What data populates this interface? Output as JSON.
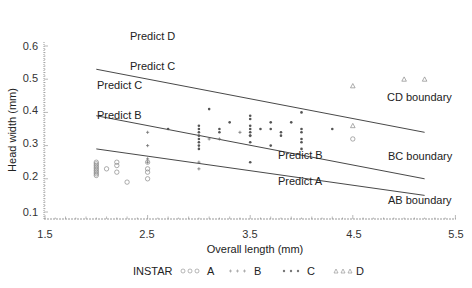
{
  "chart_data": {
    "type": "scatter",
    "title": "",
    "xlabel": "Overall length (mm)",
    "ylabel": "Head width (mm)",
    "xlim": [
      1.5,
      5.5
    ],
    "ylim": [
      0.1,
      0.6
    ],
    "xticks": [
      "1.5",
      "2.5",
      "3.5",
      "4.5",
      "5.5"
    ],
    "yticks": [
      "0.1",
      "0.2",
      "0.3",
      "0.4",
      "0.5",
      "0.6"
    ],
    "grid": false,
    "legend": {
      "title": "INSTAR",
      "position": "bottom",
      "entries": [
        {
          "name": "A",
          "marker": "circle"
        },
        {
          "name": "B",
          "marker": "plus"
        },
        {
          "name": "C",
          "marker": "star"
        },
        {
          "name": "D",
          "marker": "triangle"
        }
      ]
    },
    "series": [
      {
        "name": "A",
        "marker": "circle",
        "points": [
          [
            2.0,
            0.25
          ],
          [
            2.0,
            0.245
          ],
          [
            2.0,
            0.24
          ],
          [
            2.0,
            0.235
          ],
          [
            2.0,
            0.23
          ],
          [
            2.0,
            0.225
          ],
          [
            2.0,
            0.22
          ],
          [
            2.0,
            0.215
          ],
          [
            2.0,
            0.21
          ],
          [
            2.1,
            0.23
          ],
          [
            2.2,
            0.25
          ],
          [
            2.2,
            0.24
          ],
          [
            2.2,
            0.22
          ],
          [
            2.3,
            0.19
          ],
          [
            2.5,
            0.25
          ],
          [
            2.5,
            0.23
          ],
          [
            2.5,
            0.22
          ],
          [
            2.5,
            0.2
          ],
          [
            4.5,
            0.32
          ]
        ]
      },
      {
        "name": "B",
        "marker": "plus",
        "points": [
          [
            2.5,
            0.34
          ],
          [
            2.5,
            0.3
          ],
          [
            2.5,
            0.26
          ],
          [
            2.5,
            0.25
          ],
          [
            3.0,
            0.25
          ],
          [
            3.0,
            0.23
          ],
          [
            3.1,
            0.32
          ],
          [
            3.2,
            0.32
          ],
          [
            3.5,
            0.33
          ],
          [
            3.4,
            0.34
          ]
        ]
      },
      {
        "name": "C",
        "marker": "star",
        "points": [
          [
            2.7,
            0.35
          ],
          [
            3.0,
            0.36
          ],
          [
            3.0,
            0.35
          ],
          [
            3.0,
            0.34
          ],
          [
            3.0,
            0.33
          ],
          [
            3.0,
            0.32
          ],
          [
            3.0,
            0.31
          ],
          [
            3.0,
            0.3
          ],
          [
            3.0,
            0.29
          ],
          [
            3.1,
            0.41
          ],
          [
            3.2,
            0.35
          ],
          [
            3.2,
            0.34
          ],
          [
            3.3,
            0.37
          ],
          [
            3.5,
            0.39
          ],
          [
            3.5,
            0.38
          ],
          [
            3.5,
            0.36
          ],
          [
            3.5,
            0.35
          ],
          [
            3.5,
            0.34
          ],
          [
            3.5,
            0.33
          ],
          [
            3.5,
            0.31
          ],
          [
            3.5,
            0.25
          ],
          [
            3.6,
            0.35
          ],
          [
            3.7,
            0.37
          ],
          [
            3.7,
            0.35
          ],
          [
            3.7,
            0.3
          ],
          [
            3.8,
            0.34
          ],
          [
            3.8,
            0.33
          ],
          [
            3.9,
            0.37
          ],
          [
            4.0,
            0.4
          ],
          [
            4.0,
            0.35
          ],
          [
            4.0,
            0.34
          ],
          [
            4.0,
            0.32
          ],
          [
            4.0,
            0.31
          ],
          [
            4.0,
            0.29
          ],
          [
            4.3,
            0.35
          ]
        ]
      },
      {
        "name": "D",
        "marker": "triangle",
        "points": [
          [
            4.5,
            0.48
          ],
          [
            4.5,
            0.36
          ],
          [
            5.0,
            0.5
          ],
          [
            5.2,
            0.5
          ]
        ]
      }
    ],
    "boundaries": [
      {
        "name": "CD boundary",
        "x": [
          2.0,
          5.2
        ],
        "y": [
          0.53,
          0.34
        ]
      },
      {
        "name": "BC boundary",
        "x": [
          2.0,
          5.2
        ],
        "y": [
          0.39,
          0.2
        ]
      },
      {
        "name": "AB boundary",
        "x": [
          2.0,
          5.2
        ],
        "y": [
          0.29,
          0.15
        ]
      }
    ],
    "annotations": [
      "Predict D",
      "Predict C",
      "Predict C",
      "Predict B",
      "Predict B",
      "Predict A",
      "CD boundary",
      "BC boundary",
      "AB boundary"
    ]
  },
  "labels": {
    "xlabel": "Overall length (mm)",
    "ylabel": "Head width (mm)",
    "predict_d": "Predict D",
    "predict_c_upper": "Predict C",
    "predict_c_left": "Predict C",
    "predict_b_left": "Predict B",
    "predict_b_right": "Predict B",
    "predict_a": "Predict A",
    "cd_boundary": "CD boundary",
    "bc_boundary": "BC boundary",
    "ab_boundary": "AB boundary",
    "legend_title": "INSTAR",
    "legend_a": "A",
    "legend_b": "B",
    "legend_c": "C",
    "legend_d": "D"
  },
  "ticks": {
    "x": [
      "1.5",
      "2.5",
      "3.5",
      "4.5",
      "5.5"
    ],
    "y": [
      "0.6",
      "0.5",
      "0.4",
      "0.3",
      "0.2",
      "0.1"
    ]
  }
}
